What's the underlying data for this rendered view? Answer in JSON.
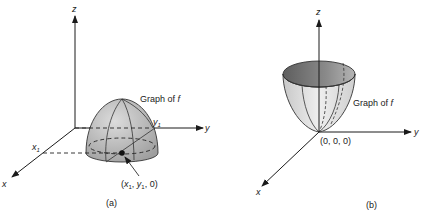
{
  "figure": {
    "panels": [
      {
        "id": "a",
        "caption": "(a)",
        "axes": {
          "x": "x",
          "y": "y",
          "z": "z"
        },
        "surface_label": "Graph of f",
        "surface_shape": "downward-opening paraboloid (dome)",
        "point_label": "(x1, y1, 0)",
        "point_label_parts": {
          "open": "(",
          "x": "x",
          "x_sub": "1",
          "sep1": ", ",
          "y": "y",
          "y_sub": "1",
          "rest": ", 0)"
        },
        "x_tick": {
          "base": "x",
          "sub": "1"
        },
        "y_tick": {
          "base": "y",
          "sub": "1"
        }
      },
      {
        "id": "b",
        "caption": "(b)",
        "axes": {
          "x": "x",
          "y": "y",
          "z": "z"
        },
        "surface_label": "Graph of f",
        "surface_shape": "upward-opening paraboloid (bowl)",
        "origin_label": "(0, 0, 0)"
      }
    ],
    "colors": {
      "surface_fill": "#b8b8b8",
      "surface_light": "#e2e2e2",
      "bowl_inner": "#7a7a7a",
      "lines": "#1a1a1a"
    }
  }
}
